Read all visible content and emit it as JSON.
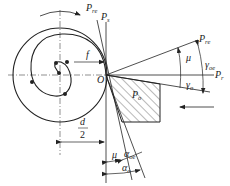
{
  "figure": {
    "type": "cutting-tool-geometry-diagram",
    "labels": {
      "p_re_top": "P",
      "p_re_top_sub": "re",
      "p_s": "P",
      "p_s_sub": "s",
      "f": "f",
      "o": "O",
      "p_o": "P",
      "p_o_sub": "o",
      "p_re_right": "P",
      "p_re_right_sub": "re",
      "mu_top": "μ",
      "gamma_oe": "γ",
      "gamma_oe_sub": "oe",
      "p_r": "P",
      "p_r_sub": "r",
      "gamma_o": "γ",
      "gamma_o_sub": "o",
      "d_num": "d",
      "d_den": "2",
      "mu_bottom": "μ",
      "alpha_oe": "α",
      "alpha_oe_sub": "oe",
      "alpha_o": "α",
      "alpha_o_sub": "o"
    },
    "colors": {
      "line": "#222222",
      "hatch": "#333333",
      "background": "#ffffff"
    }
  }
}
